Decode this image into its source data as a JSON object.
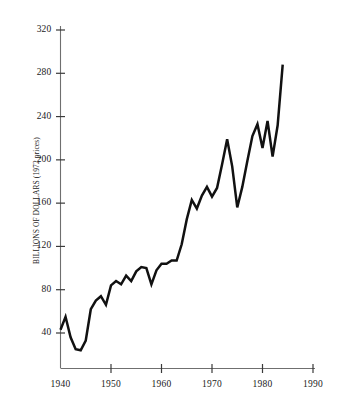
{
  "chart_data": {
    "type": "line",
    "title": "",
    "xlabel": "",
    "ylabel": "BILLIONS OF DOLLARS (1972 prices)",
    "xlim": [
      1940,
      1990
    ],
    "ylim": [
      0,
      336
    ],
    "grid": false,
    "legend": null,
    "xticks": [
      1940,
      1950,
      1960,
      1970,
      1980,
      1990
    ],
    "yticks": [
      40,
      80,
      120,
      160,
      200,
      240,
      280,
      320
    ],
    "xtick_labels": [
      "1940",
      "1950",
      "1960",
      "1970",
      "1980",
      "1990"
    ],
    "ytick_labels": [
      "40",
      "80",
      "120",
      "160",
      "200",
      "240",
      "280",
      "320"
    ],
    "series": [
      {
        "name": "Real business fixed investment",
        "x": [
          1940,
          1941,
          1942,
          1943,
          1944,
          1945,
          1946,
          1947,
          1948,
          1949,
          1950,
          1951,
          1952,
          1953,
          1954,
          1955,
          1956,
          1957,
          1958,
          1959,
          1960,
          1961,
          1962,
          1963,
          1964,
          1965,
          1966,
          1967,
          1968,
          1969,
          1970,
          1971,
          1972,
          1973,
          1974,
          1975,
          1976,
          1977,
          1978,
          1979,
          1980,
          1981,
          1982,
          1983,
          1984
        ],
        "values": [
          43,
          55,
          36,
          25,
          24,
          33,
          62,
          70,
          74,
          66,
          84,
          88,
          85,
          93,
          88,
          97,
          101,
          100,
          85,
          98,
          104,
          104,
          107,
          107,
          122,
          145,
          163,
          155,
          167,
          175,
          166,
          174,
          196,
          219,
          194,
          156,
          175,
          199,
          222,
          233,
          211,
          236,
          203,
          232,
          288
        ]
      }
    ]
  },
  "axis": {
    "y_title": "BILLIONS OF DOLLARS (1972 prices)"
  }
}
